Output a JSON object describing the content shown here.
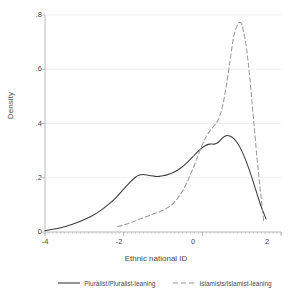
{
  "chart_data": {
    "type": "line",
    "title": "",
    "subtitle": "",
    "xlabel": "Ethnic national ID",
    "ylabel": "Density",
    "xlim": [
      -4,
      2
    ],
    "ylim": [
      0,
      0.8
    ],
    "xticks": [
      "-4",
      "-2",
      "0",
      "2"
    ],
    "xtick_values": [
      -4,
      -2,
      0,
      2
    ],
    "yticks": [
      "0",
      ".2",
      ".4",
      ".6",
      ".8"
    ],
    "ytick_values": [
      0,
      0.2,
      0.4,
      0.6,
      0.8
    ],
    "grid": "horizontal-faint",
    "legend_position": "below-axis",
    "series": [
      {
        "name": "Pluralist/Pluralist-leaning",
        "style": "solid",
        "color": "#3c3c3c",
        "x": [
          -4.0,
          -3.8,
          -3.6,
          -3.4,
          -3.2,
          -3.0,
          -2.8,
          -2.6,
          -2.4,
          -2.2,
          -2.0,
          -1.85,
          -1.7,
          -1.6,
          -1.5,
          -1.4,
          -1.3,
          -1.2,
          -1.1,
          -1.0,
          -0.85,
          -0.7,
          -0.55,
          -0.4,
          -0.25,
          -0.1,
          0.05,
          0.18,
          0.3,
          0.4,
          0.5,
          0.6,
          0.7,
          0.8,
          0.9,
          1.0,
          1.1,
          1.2,
          1.3,
          1.4,
          1.5,
          1.62
        ],
        "values": [
          0.005,
          0.01,
          0.016,
          0.024,
          0.034,
          0.046,
          0.06,
          0.078,
          0.1,
          0.126,
          0.158,
          0.182,
          0.202,
          0.21,
          0.212,
          0.21,
          0.207,
          0.205,
          0.205,
          0.207,
          0.213,
          0.222,
          0.236,
          0.254,
          0.276,
          0.298,
          0.316,
          0.324,
          0.324,
          0.33,
          0.345,
          0.355,
          0.354,
          0.344,
          0.326,
          0.3,
          0.266,
          0.226,
          0.182,
          0.136,
          0.092,
          0.048
        ]
      },
      {
        "name": "Islamists/Islamist-leaning",
        "style": "dashed",
        "color": "#9a9a9a",
        "x": [
          -2.15,
          -2.0,
          -1.85,
          -1.7,
          -1.55,
          -1.4,
          -1.25,
          -1.1,
          -1.0,
          -0.9,
          -0.8,
          -0.7,
          -0.6,
          -0.5,
          -0.4,
          -0.3,
          -0.2,
          -0.1,
          0.0,
          0.1,
          0.2,
          0.3,
          0.4,
          0.5,
          0.6,
          0.7,
          0.8,
          0.9,
          0.95,
          1.0,
          1.1,
          1.2,
          1.3,
          1.4,
          1.5,
          1.56
        ],
        "values": [
          0.02,
          0.026,
          0.033,
          0.041,
          0.05,
          0.058,
          0.066,
          0.074,
          0.08,
          0.088,
          0.098,
          0.112,
          0.13,
          0.152,
          0.18,
          0.212,
          0.248,
          0.286,
          0.322,
          0.352,
          0.374,
          0.392,
          0.412,
          0.456,
          0.53,
          0.628,
          0.722,
          0.766,
          0.772,
          0.764,
          0.7,
          0.58,
          0.42,
          0.258,
          0.12,
          0.04
        ]
      }
    ],
    "annotations": []
  },
  "legend": {
    "entries": [
      {
        "label": "Pluralist/Pluralist-leaning",
        "swatch": "solid-line-swatch"
      },
      {
        "label": "Islamists/Islamist-leaning",
        "swatch": "dashed-line-swatch"
      }
    ]
  },
  "colors": {
    "series_1": "#3c3c3c",
    "series_2": "#9a9a9a",
    "axis": "#a8a8a8",
    "grid": "#e8e8e8",
    "text": "#4a4a4a",
    "background": "#ffffff"
  }
}
